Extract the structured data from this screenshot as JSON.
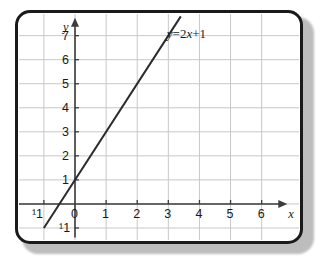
{
  "figure": {
    "frame": {
      "border_color": "#1a1a1a",
      "background_color": "#ffffff",
      "shadow_color": "#bdbdbd"
    }
  },
  "chart_data": {
    "type": "line",
    "title": "",
    "xlabel": "x",
    "ylabel": "y",
    "equation_label": "y = 2x + 1",
    "equation_parts": {
      "lhs": "y",
      "equals": "=",
      "slope": "2",
      "variable": "x",
      "plus": "+",
      "intercept": "1"
    },
    "slope": 2,
    "y_intercept": 1,
    "xlim": [
      -1.8,
      7.2
    ],
    "ylim": [
      -1.5,
      7.9
    ],
    "xticks": [
      -1,
      0,
      1,
      2,
      3,
      4,
      5,
      6
    ],
    "xtick_labels": [
      "¹1",
      "0",
      "1",
      "2",
      "3",
      "4",
      "5",
      "6"
    ],
    "yticks": [
      -1,
      1,
      2,
      3,
      4,
      5,
      6,
      7
    ],
    "ytick_labels": [
      "¹1",
      "1",
      "2",
      "3",
      "4",
      "5",
      "6",
      "7"
    ],
    "grid": true,
    "grid_color": "#c8c8c8",
    "axis_color": "#3c3c3c",
    "line_color": "#2b2b2b",
    "legend": "none",
    "x": [
      -1,
      3.4
    ],
    "y": [
      -1,
      7.8
    ],
    "points": [
      {
        "x": -1,
        "y": -1
      },
      {
        "x": 0,
        "y": 1
      },
      {
        "x": 1,
        "y": 3
      },
      {
        "x": 2,
        "y": 5
      },
      {
        "x": 3,
        "y": 7
      }
    ],
    "axis_arrows": [
      "x-positive",
      "y-positive"
    ]
  }
}
